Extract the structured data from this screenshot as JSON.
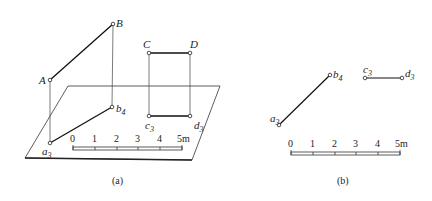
{
  "figure_a": {
    "caption": "(a)",
    "points": {
      "A": {
        "label": "A",
        "x": 50,
        "y": 80
      },
      "B": {
        "label": "B",
        "x": 113,
        "y": 24
      },
      "a3": {
        "label": "a",
        "sub": "3",
        "x": 50,
        "y": 143
      },
      "b4": {
        "label": "b",
        "sub": "4",
        "x": 112,
        "y": 107
      },
      "C": {
        "label": "C",
        "x": 149,
        "y": 53
      },
      "D": {
        "label": "D",
        "x": 190,
        "y": 53
      },
      "c3": {
        "label": "c",
        "sub": "3",
        "x": 149,
        "y": 116
      },
      "d3": {
        "label": "d",
        "sub": "3",
        "x": 190,
        "y": 116
      }
    },
    "scale": {
      "ticks": [
        "0",
        "1",
        "2",
        "3",
        "4",
        "5m"
      ]
    }
  },
  "figure_b": {
    "caption": "(b)",
    "points": {
      "a3": {
        "label": "a",
        "sub": "3"
      },
      "b4": {
        "label": "b",
        "sub": "4"
      },
      "c3": {
        "label": "c",
        "sub": "3"
      },
      "d3": {
        "label": "d",
        "sub": "3"
      }
    },
    "scale": {
      "ticks": [
        "0",
        "1",
        "2",
        "3",
        "4",
        "5m"
      ]
    }
  }
}
